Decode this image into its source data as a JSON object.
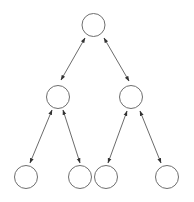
{
  "diagram": {
    "type": "binary-tree",
    "directed": "bidirectional",
    "colors": {
      "background": "#ffffff",
      "node_stroke": "#6e6e6e",
      "edge_stroke": "#5a5a5a",
      "arrowhead": "#333333"
    },
    "node_radius": 11.5,
    "nodes": [
      {
        "id": "root",
        "label": "",
        "level": 0,
        "cx": 93.5,
        "cy": 25
      },
      {
        "id": "left",
        "label": "",
        "level": 1,
        "cx": 58,
        "cy": 97
      },
      {
        "id": "right",
        "label": "",
        "level": 1,
        "cx": 131,
        "cy": 97
      },
      {
        "id": "left-left",
        "label": "",
        "level": 2,
        "cx": 26,
        "cy": 177
      },
      {
        "id": "left-right",
        "label": "",
        "level": 2,
        "cx": 80,
        "cy": 177
      },
      {
        "id": "right-left",
        "label": "",
        "level": 2,
        "cx": 106,
        "cy": 177
      },
      {
        "id": "right-right",
        "label": "",
        "level": 2,
        "cx": 167,
        "cy": 177
      }
    ],
    "edges": [
      {
        "from": "root",
        "to": "left",
        "x1": 85,
        "y1": 38,
        "x2": 61,
        "y2": 80
      },
      {
        "from": "root",
        "to": "right",
        "x1": 104,
        "y1": 38,
        "x2": 129,
        "y2": 81
      },
      {
        "from": "left",
        "to": "left-left",
        "x1": 52,
        "y1": 110,
        "x2": 30,
        "y2": 163
      },
      {
        "from": "left",
        "to": "left-right",
        "x1": 63,
        "y1": 110,
        "x2": 80,
        "y2": 163
      },
      {
        "from": "right",
        "to": "right-left",
        "x1": 127,
        "y1": 111,
        "x2": 108,
        "y2": 163
      },
      {
        "from": "right",
        "to": "right-right",
        "x1": 140,
        "y1": 111,
        "x2": 161,
        "y2": 163
      }
    ]
  }
}
